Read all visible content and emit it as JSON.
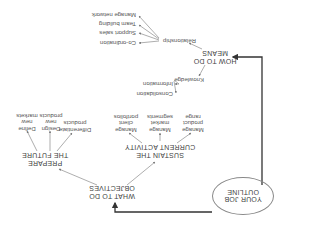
{
  "diagram": {
    "orientation": "rotated 180 degrees",
    "root": {
      "line1": "YOUR JOB",
      "line2": "OUTLINE"
    },
    "objectives": {
      "line1": "WHAT TO DO",
      "line2": "OBJECTIVES",
      "branches": [
        {
          "line1": "SUSTAIN THE",
          "line2": "CURRENT ACTIVITY",
          "items": [
            {
              "line1": "Manage",
              "line2": "product",
              "line3": "range"
            },
            {
              "line1": "Manage",
              "line2": "market",
              "line3": "segments"
            },
            {
              "line1": "Manage",
              "line2": "client",
              "line3": "portfolios"
            }
          ]
        },
        {
          "line1": "PREPARE",
          "line2": "THE FUTURE",
          "items": [
            {
              "line1": "Differentiate",
              "line2": "products",
              "line3": ""
            },
            {
              "line1": "Design",
              "line2": "new",
              "line3": "products"
            },
            {
              "line1": "Define",
              "line2": "new",
              "line3": "markets"
            }
          ]
        }
      ]
    },
    "means": {
      "line1": "HOW TO DO",
      "line2": "MEANS",
      "branches": [
        {
          "label": "Relationship",
          "items": [
            "Co-ordination",
            "Support sales",
            "Team building",
            "Manage network"
          ]
        },
        {
          "label": "Knowledge",
          "items": [
            "Information",
            "Consolidation"
          ]
        }
      ]
    },
    "colors": {
      "line": "#333333",
      "arrow": "#888888",
      "text": "#555555"
    }
  }
}
